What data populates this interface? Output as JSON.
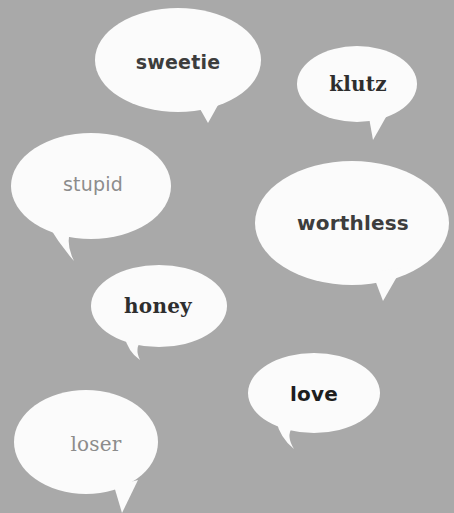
{
  "background_color": "#a9a9a9",
  "bubble_color": "#fbfbfb",
  "bubbles": [
    {
      "word": "sweetie",
      "color": "#3d3d3d",
      "style": "sans"
    },
    {
      "word": "klutz",
      "color": "#2e2e2e",
      "style": "serif"
    },
    {
      "word": "stupid",
      "color": "#8c8c8c",
      "style": "sans"
    },
    {
      "word": "worthless",
      "color": "#3d3d3d",
      "style": "sans"
    },
    {
      "word": "honey",
      "color": "#2e2e2e",
      "style": "serif"
    },
    {
      "word": "love",
      "color": "#1e1e1e",
      "style": "sans"
    },
    {
      "word": "loser",
      "color": "#8c8c8c",
      "style": "serif"
    }
  ]
}
